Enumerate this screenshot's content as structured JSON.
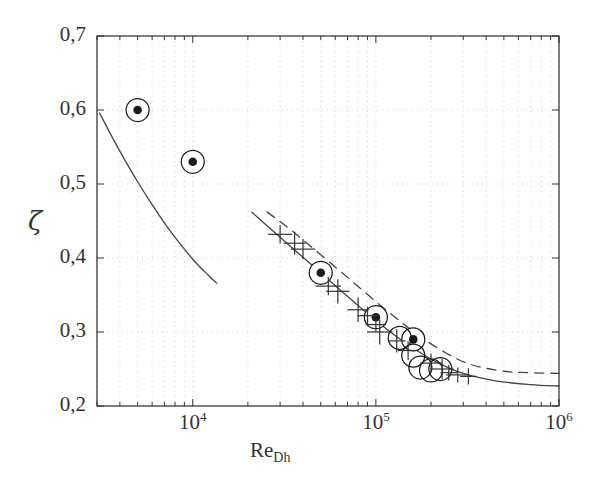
{
  "chart_data": {
    "type": "scatter",
    "title": "",
    "xlabel": "Re_Dh",
    "xlabel_base": "Re",
    "xlabel_sub": "Dh",
    "ylabel": "ζ",
    "xscale": "log",
    "yscale": "linear",
    "xlim": [
      3000,
      1000000
    ],
    "ylim": [
      0.2,
      0.7
    ],
    "grid": true,
    "grid_style": "dotted",
    "legend": "none",
    "xticks": [
      10000,
      100000,
      1000000
    ],
    "xtick_labels": [
      "10⁴",
      "10⁵",
      "10⁶"
    ],
    "xtick_mantissas": [
      "10",
      "10",
      "10"
    ],
    "xtick_exponents": [
      "4",
      "5",
      "6"
    ],
    "yticks": [
      0.2,
      0.3,
      0.4,
      0.5,
      0.6,
      0.7
    ],
    "ytick_labels": [
      "0,2",
      "0,3",
      "0,4",
      "0,5",
      "0,6",
      "0,7"
    ],
    "decimal_separator": ",",
    "series": [
      {
        "name": "circled-dot-markers",
        "marker": "circle-with-filled-dot",
        "color": "#1a1a1a",
        "points": [
          {
            "x": 5000,
            "y": 0.6
          },
          {
            "x": 10000,
            "y": 0.53
          },
          {
            "x": 50000,
            "y": 0.38
          },
          {
            "x": 100000,
            "y": 0.32
          },
          {
            "x": 160000,
            "y": 0.29
          }
        ]
      },
      {
        "name": "open-circle-markers",
        "marker": "open-circle",
        "color": "#1a1a1a",
        "points": [
          {
            "x": 135000,
            "y": 0.292
          },
          {
            "x": 160000,
            "y": 0.268
          },
          {
            "x": 175000,
            "y": 0.252
          },
          {
            "x": 200000,
            "y": 0.248
          },
          {
            "x": 225000,
            "y": 0.25
          }
        ]
      },
      {
        "name": "plus-markers",
        "marker": "plus",
        "color": "#333333",
        "points": [
          {
            "x": 30000,
            "y": 0.432
          },
          {
            "x": 36000,
            "y": 0.42
          },
          {
            "x": 40000,
            "y": 0.412
          },
          {
            "x": 55000,
            "y": 0.362
          },
          {
            "x": 62000,
            "y": 0.355
          },
          {
            "x": 80000,
            "y": 0.33
          },
          {
            "x": 90000,
            "y": 0.322
          },
          {
            "x": 100000,
            "y": 0.31
          },
          {
            "x": 105000,
            "y": 0.3
          },
          {
            "x": 130000,
            "y": 0.288
          },
          {
            "x": 150000,
            "y": 0.275
          },
          {
            "x": 200000,
            "y": 0.258
          },
          {
            "x": 230000,
            "y": 0.25
          },
          {
            "x": 250000,
            "y": 0.245
          },
          {
            "x": 280000,
            "y": 0.242
          },
          {
            "x": 320000,
            "y": 0.24
          }
        ]
      }
    ],
    "curves": [
      {
        "name": "left-solid-curve",
        "style": "solid",
        "color": "#444444",
        "points": [
          {
            "x": 3100,
            "y": 0.596
          },
          {
            "x": 3600,
            "y": 0.565
          },
          {
            "x": 4200,
            "y": 0.535
          },
          {
            "x": 5000,
            "y": 0.503
          },
          {
            "x": 6000,
            "y": 0.472
          },
          {
            "x": 7200,
            "y": 0.443
          },
          {
            "x": 8600,
            "y": 0.418
          },
          {
            "x": 10200,
            "y": 0.396
          },
          {
            "x": 12000,
            "y": 0.378
          },
          {
            "x": 13500,
            "y": 0.366
          }
        ]
      },
      {
        "name": "main-solid-curve",
        "style": "solid",
        "color": "#444444",
        "points": [
          {
            "x": 21000,
            "y": 0.462
          },
          {
            "x": 30000,
            "y": 0.428
          },
          {
            "x": 45000,
            "y": 0.39
          },
          {
            "x": 65000,
            "y": 0.355
          },
          {
            "x": 90000,
            "y": 0.325
          },
          {
            "x": 120000,
            "y": 0.3
          },
          {
            "x": 160000,
            "y": 0.278
          },
          {
            "x": 220000,
            "y": 0.258
          },
          {
            "x": 300000,
            "y": 0.244
          },
          {
            "x": 450000,
            "y": 0.234
          },
          {
            "x": 700000,
            "y": 0.229
          },
          {
            "x": 1000000,
            "y": 0.227
          }
        ]
      },
      {
        "name": "dashed-curve",
        "style": "dashed",
        "color": "#444444",
        "points": [
          {
            "x": 25500,
            "y": 0.462
          },
          {
            "x": 32000,
            "y": 0.444
          },
          {
            "x": 42000,
            "y": 0.42
          },
          {
            "x": 60000,
            "y": 0.388
          },
          {
            "x": 85000,
            "y": 0.356
          },
          {
            "x": 120000,
            "y": 0.325
          },
          {
            "x": 170000,
            "y": 0.296
          },
          {
            "x": 240000,
            "y": 0.272
          },
          {
            "x": 330000,
            "y": 0.256
          },
          {
            "x": 500000,
            "y": 0.247
          },
          {
            "x": 700000,
            "y": 0.245
          },
          {
            "x": 1000000,
            "y": 0.244
          }
        ]
      }
    ],
    "colors": {
      "axis": "#333333",
      "grid": "#c9c9c9",
      "marker": "#1a1a1a",
      "curve": "#444444",
      "background": "#ffffff"
    }
  }
}
